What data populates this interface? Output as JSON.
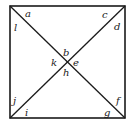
{
  "diagram": {
    "labels": {
      "top_left_upper": "a",
      "top_left_lower": "l",
      "top_right_upper": "c",
      "top_right_lower": "d",
      "center_top": "b",
      "center_right": "e",
      "center_bottom": "h",
      "center_left": "k",
      "bottom_left_upper": "j",
      "bottom_left_lower": "i",
      "bottom_right_upper": "f",
      "bottom_right_lower": "g"
    }
  }
}
